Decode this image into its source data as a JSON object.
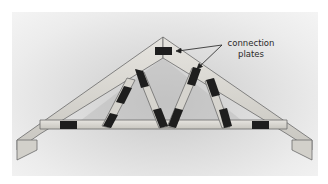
{
  "figure": {
    "labels": {
      "annotation_line1": "connection",
      "annotation_line2": "plates"
    }
  },
  "colors": {
    "wood": "#d8d6d0",
    "wood_edge": "#6a6a6a",
    "plate": "#1e1e1e",
    "background": "#dedede"
  }
}
